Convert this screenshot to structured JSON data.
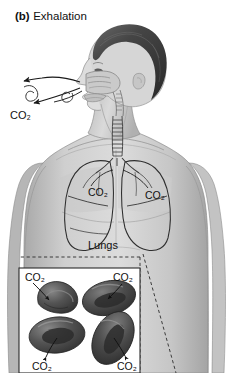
{
  "figure": {
    "panel_letter": "(b)",
    "panel_title": "Exhalation",
    "caption_full": "(b) Exhalation",
    "view": "anterior torso with lateral head cutaway"
  },
  "labels": {
    "airway_co2": "CO₂",
    "lung_left_co2": "CO₂",
    "lung_right_co2": "CO₂",
    "lungs": "Lungs",
    "inset_co2_top_left": "CO₂",
    "inset_co2_top_right": "CO₂",
    "inset_co2_bottom_left": "CO₂",
    "inset_co2_bottom_right": "CO₂"
  },
  "inset": {
    "name": "red-blood-cells-inset",
    "content": "four red blood cells releasing carbon dioxide",
    "cell_count": 4,
    "connector_style": "dashed"
  },
  "colors": {
    "background": "#ffffff",
    "text": "#111111",
    "skin_light": "#d2d2d2",
    "skin_mid": "#b9b9b9",
    "skin_shadow": "#9a9a9a",
    "hair_dark": "#3b3b3b",
    "hair_mid": "#585858",
    "outline": "#2a2a2a",
    "cell_dark": "#3a3a3a",
    "cell_mid": "#575757",
    "cell_light": "#7a7a7a",
    "inset_border": "#2a2a2a",
    "arrow": "#1a1a1a"
  }
}
